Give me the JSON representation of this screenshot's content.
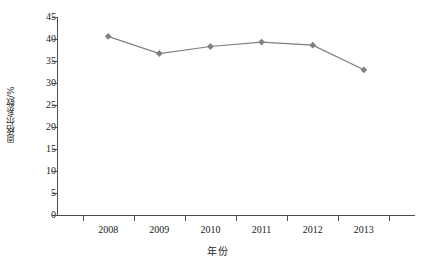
{
  "chart_data": {
    "type": "line",
    "title": "",
    "xlabel": "年份",
    "ylabel": "恩格尔系数/%",
    "categories": [
      "2008",
      "2009",
      "2010",
      "2011",
      "2012",
      "2013"
    ],
    "values": [
      40.6,
      36.7,
      38.3,
      39.3,
      38.6,
      33.0
    ],
    "series": [
      {
        "name": "恩格尔系数",
        "values": [
          40.6,
          36.7,
          38.3,
          39.3,
          38.6,
          33.0
        ]
      }
    ],
    "ylim": [
      0,
      45
    ],
    "ytick_labels": [
      "45",
      "40",
      "35",
      "30",
      "25",
      "20",
      "15",
      "10",
      "5",
      "0"
    ],
    "ytick_values": [
      45,
      40,
      35,
      30,
      25,
      20,
      15,
      10,
      5,
      0
    ],
    "xtick_labels": [
      "2008",
      "2009",
      "2010",
      "2011",
      "2012",
      "2013"
    ],
    "grid": false,
    "legend": false,
    "legend_position": "none",
    "marker": "diamond",
    "line_color": "#7f7f7f",
    "marker_color": "#808080",
    "axis_color": "#4d4d4d",
    "background_color": "#ffffff"
  },
  "axes": {
    "y_title": "恩格尔系数/%",
    "x_title": "年份"
  }
}
